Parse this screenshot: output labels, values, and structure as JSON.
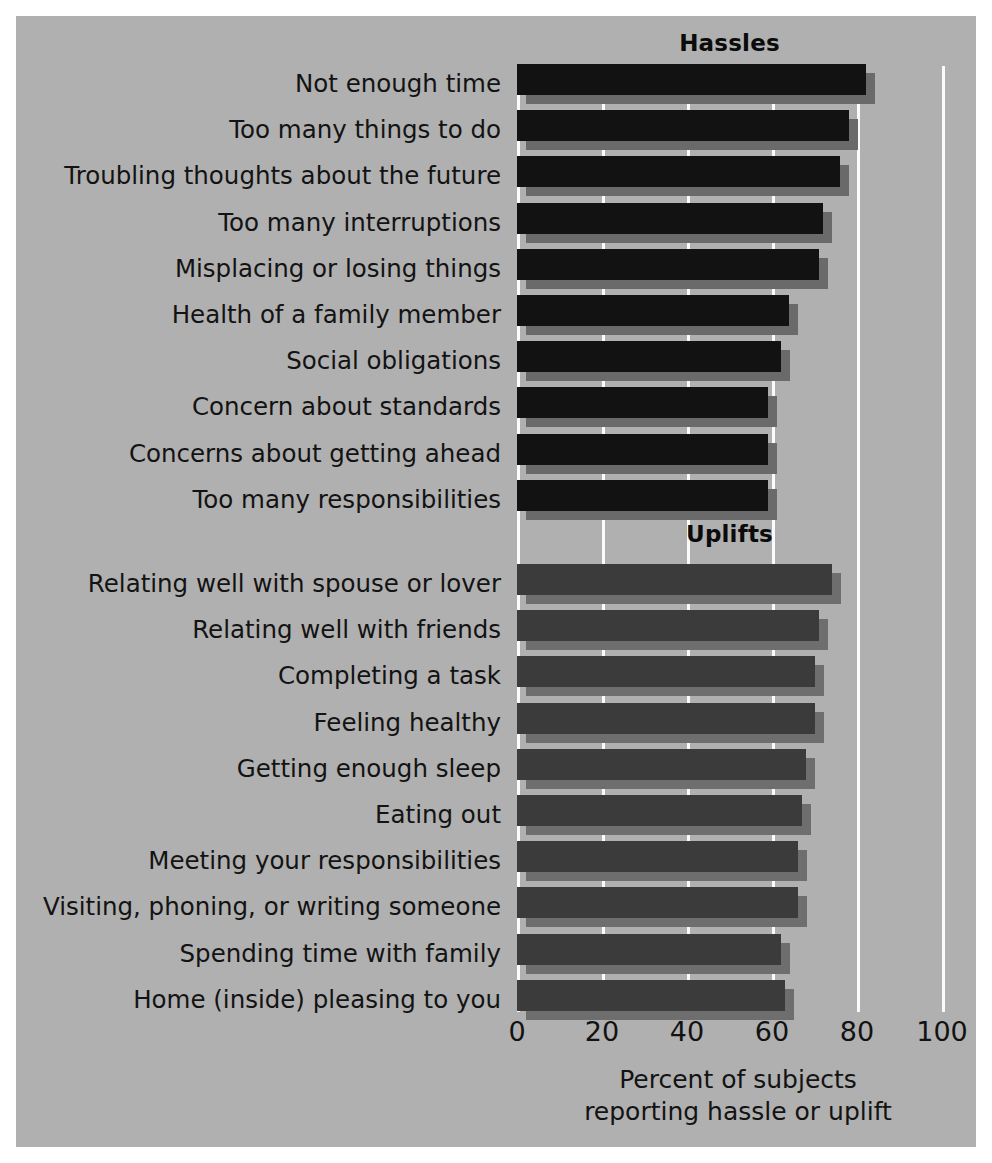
{
  "chart_data": {
    "type": "bar",
    "orientation": "horizontal",
    "title": "",
    "xlabel": "Percent of subjects reporting hassle or uplift",
    "ylabel": "",
    "xlim": [
      0,
      100
    ],
    "xticks": [
      0,
      20,
      40,
      60,
      80,
      100
    ],
    "xtick_labels": [
      "0",
      "20",
      "40",
      "60",
      "80",
      "100"
    ],
    "grid": true,
    "legend": "none",
    "groups": [
      {
        "name": "Hassles",
        "heading": "Hassles",
        "bar_color": "#121212",
        "shadow_color": "#6a6a6a",
        "categories": [
          "Not enough time",
          "Too many things to do",
          "Troubling thoughts about the future",
          "Too many interruptions",
          "Misplacing or losing things",
          "Health of a family member",
          "Social obligations",
          "Concern about standards",
          "Concerns about getting ahead",
          "Too many responsibilities"
        ],
        "values": [
          82,
          78,
          76,
          72,
          71,
          64,
          62,
          59,
          59,
          59
        ]
      },
      {
        "name": "Uplifts",
        "heading": "Uplifts",
        "bar_color": "#3b3b3b",
        "shadow_color": "#6e6e6e",
        "categories": [
          "Relating well with spouse or lover",
          "Relating well with friends",
          "Completing a task",
          "Feeling healthy",
          "Getting enough sleep",
          "Eating out",
          "Meeting your responsibilities",
          "Visiting, phoning, or writing someone",
          "Spending time with family",
          "Home (inside) pleasing to you"
        ],
        "values": [
          74,
          71,
          70,
          70,
          68,
          67,
          66,
          66,
          62,
          63
        ]
      }
    ]
  },
  "axis": {
    "title_line1": "Percent of subjects",
    "title_line2": "reporting hassle or uplift"
  },
  "colors": {
    "panel_background": "#b0b0b0",
    "figure_background": "#ffffff",
    "gridline": "#fbfbfb",
    "text": "#131313",
    "hassles_bar": "#121212",
    "uplifts_bar": "#3b3b3b"
  }
}
